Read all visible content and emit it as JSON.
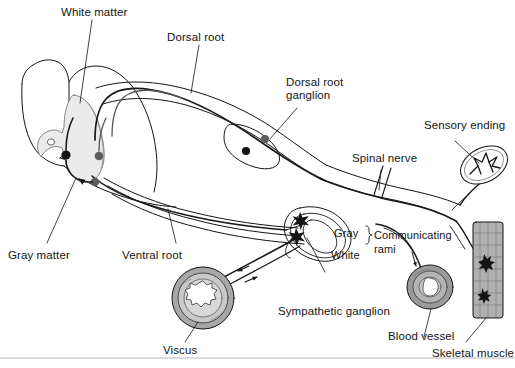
{
  "figure": {
    "type": "anatomical-diagram",
    "background_color": "#ffffff",
    "ink_color": "#141414",
    "gray_matter_fill": "#ebebeb",
    "tissue_fill": "#9e9e9e",
    "width": 515,
    "height": 368
  },
  "labels": {
    "white_matter": "White matter",
    "dorsal_root": "Dorsal root",
    "dorsal_root_ganglion_line1": "Dorsal root",
    "dorsal_root_ganglion_line2": "ganglion",
    "sensory_ending": "Sensory ending",
    "spinal_nerve": "Spinal nerve",
    "gray_matter": "Gray matter",
    "ventral_root": "Ventral root",
    "gray": "Gray",
    "white": "White",
    "communicating_line1": "Communicating",
    "communicating_line2": "rami",
    "sympathetic_ganglion": "Sympathetic ganglion",
    "viscus": "Viscus",
    "blood_vessel": "Blood vessel",
    "skeletal_muscle": "Skeletal muscle"
  },
  "structures": {
    "spinal_cord": "spinal-cord-cross-section",
    "gray_matter_butterfly": "gray-matter-butterfly",
    "central_canal": "central-canal",
    "dorsal_root_fibers": "dorsal-root-fibers",
    "ventral_root_fibers": "ventral-root-fibers",
    "dorsal_root_ganglion_cells": "dorsal-root-ganglion-cell-bodies",
    "spinal_nerve_trunk": "spinal-nerve-trunk",
    "spinal_nerve_break": "spinal-nerve-break-marks",
    "sympathetic_chain_ganglion": "sympathetic-chain-ganglion",
    "synapse_markers": "synapse-star-markers",
    "communicating_rami_brace": "communicating-rami-brace",
    "sensory_receptor": "sensory-ending-receptor",
    "viscus_organ": "viscus-cross-section",
    "blood_vessel_organ": "blood-vessel-cross-section",
    "skeletal_muscle_organ": "skeletal-muscle-fiber-block",
    "motor_endplate": "motor-endplate",
    "baseline_rule": "bottom-horizontal-rule",
    "neuron_soma_dots": "neuron-cell-body-dots",
    "direction_arrows": "signal-direction-arrows"
  }
}
